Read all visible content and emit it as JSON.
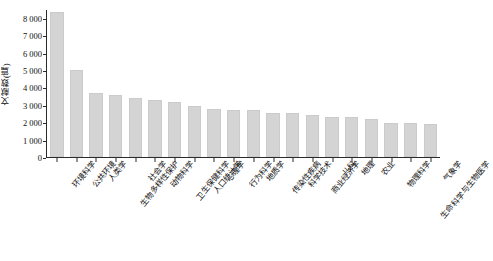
{
  "chart_data": {
    "type": "bar",
    "title": "",
    "xlabel": "",
    "ylabel": "文献数(篇)",
    "ylim": [
      0,
      8500
    ],
    "grid": false,
    "legend": null,
    "yticks": [
      "0",
      "1 000",
      "2 000",
      "3 000",
      "4 000",
      "5 000",
      "6 000",
      "7 000",
      "8 000"
    ],
    "ytick_values": [
      0,
      1000,
      2000,
      3000,
      4000,
      5000,
      6000,
      7000,
      8000
    ],
    "bar_color": "#d4d4d4",
    "bar_edge_color": "#cbcbcb",
    "axis_color": "#2b2b2b",
    "categories": [
      "环境科学",
      "公共环境",
      "人类学",
      "生物多样性保护",
      "社会学",
      "动物科学",
      "卫生保健科学",
      "人口统计学",
      "心理学",
      "行为科学",
      "地质学",
      "传染性疾病",
      "科学技术",
      "商业经济学",
      "儿科",
      "地理",
      "农业",
      "物理科学",
      "生命科学与生物医学",
      "气象学"
    ],
    "values": [
      8400,
      5020,
      3720,
      3560,
      3410,
      3320,
      3200,
      2960,
      2790,
      2740,
      2700,
      2560,
      2520,
      2430,
      2340,
      2290,
      2220,
      1960,
      1940,
      1930
    ]
  }
}
